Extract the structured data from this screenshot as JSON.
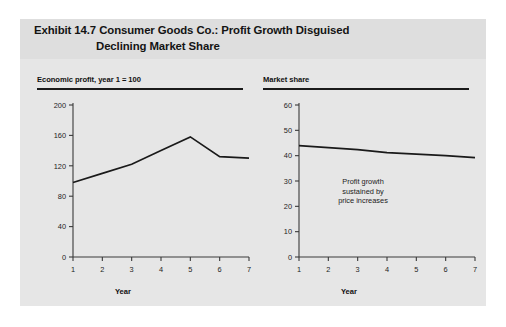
{
  "exhibit": {
    "title_line1": "Exhibit 14.7  Consumer Goods Co.: Profit Growth Disguised",
    "title_line2": "Declining Market Share",
    "background_color": "#e6e6e6",
    "title_band_color": "#dedede"
  },
  "charts": [
    {
      "header": "Economic profit, year 1 = 100",
      "xlabel": "Year",
      "annotation": ""
    },
    {
      "header": "Market share",
      "xlabel": "Year",
      "annotation_line1": "Profit growth",
      "annotation_line2": "sustained by",
      "annotation_line3": "price increases"
    }
  ],
  "chart_data": [
    {
      "type": "line",
      "title": "Economic profit, year 1 = 100",
      "xlabel": "Year",
      "ylabel": "",
      "x": [
        1,
        2,
        3,
        4,
        5,
        6,
        7
      ],
      "xticklabels": [
        "1",
        "2",
        "3",
        "4",
        "5",
        "6",
        "7"
      ],
      "yticks": [
        0,
        40,
        80,
        120,
        160,
        200
      ],
      "yticklabels": [
        "0",
        "40",
        "80",
        "120",
        "160",
        "200"
      ],
      "xlim": [
        1,
        7
      ],
      "ylim": [
        0,
        200
      ],
      "grid": false,
      "legend": false,
      "series": [
        {
          "name": "Economic profit",
          "values": [
            98,
            110,
            122,
            140,
            158,
            132,
            130
          ],
          "color": "#1a1a1a"
        }
      ]
    },
    {
      "type": "line",
      "title": "Market share",
      "xlabel": "Year",
      "ylabel": "",
      "x": [
        1,
        2,
        3,
        4,
        5,
        6,
        7
      ],
      "xticklabels": [
        "1",
        "2",
        "3",
        "4",
        "5",
        "6",
        "7"
      ],
      "yticks": [
        0,
        10,
        20,
        30,
        40,
        50,
        60
      ],
      "yticklabels": [
        "0",
        "10",
        "20",
        "30",
        "40",
        "50",
        "60"
      ],
      "xlim": [
        1,
        7
      ],
      "ylim": [
        0,
        60
      ],
      "grid": false,
      "legend": false,
      "annotations": [
        {
          "text": "Profit growth sustained by price increases",
          "x": 3,
          "y": 23
        }
      ],
      "series": [
        {
          "name": "Market share",
          "values": [
            44,
            43.2,
            42.4,
            41.2,
            40.6,
            40.0,
            39.2
          ],
          "color": "#1a1a1a"
        }
      ]
    }
  ]
}
